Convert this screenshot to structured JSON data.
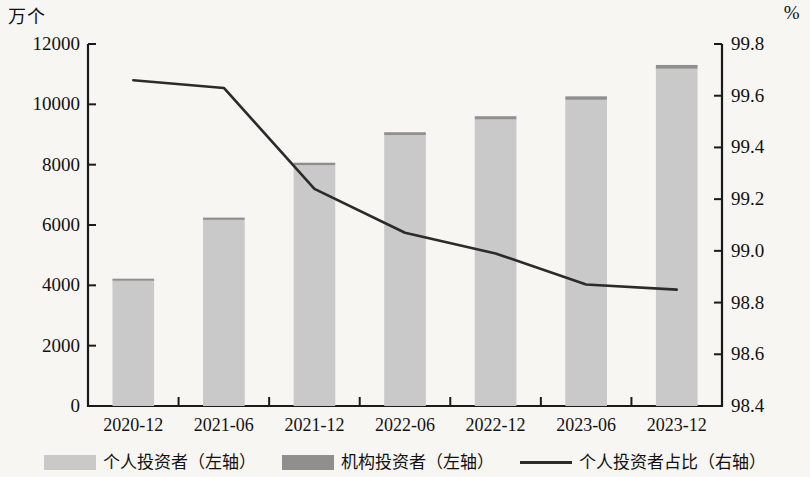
{
  "axes": {
    "left_unit": "万个",
    "right_unit": "%",
    "left_ticks": [
      "12000",
      "10000",
      "8000",
      "6000",
      "4000",
      "2000",
      "0"
    ],
    "right_ticks": [
      "99.8",
      "99.6",
      "99.4",
      "99.2",
      "99.0",
      "98.8",
      "98.6",
      "98.4"
    ]
  },
  "legend": {
    "items": [
      {
        "label": "个人投资者（左轴）",
        "type": "swatch",
        "color": "#c9c9c9"
      },
      {
        "label": "机构投资者（左轴）",
        "type": "swatch",
        "color": "#8f8f8f"
      },
      {
        "label": "个人投资者占比（右轴）",
        "type": "line",
        "color": "#2b2b2b"
      }
    ]
  },
  "chart_data": {
    "type": "bar",
    "title": "",
    "xlabel": "",
    "ylabel": "万个",
    "y2label": "%",
    "ylim": [
      0,
      12000
    ],
    "y2lim": [
      98.4,
      99.8
    ],
    "grid": false,
    "legend_position": "bottom",
    "categories": [
      "2020-12",
      "2021-06",
      "2021-12",
      "2022-06",
      "2022-12",
      "2023-06",
      "2023-12"
    ],
    "series": [
      {
        "name": "个人投资者（左轴）",
        "type": "bar",
        "stack": "investors",
        "axis": "left",
        "color": "#c9c9c9",
        "values": [
          4150,
          6170,
          7980,
          8980,
          9500,
          10150,
          11180
        ]
      },
      {
        "name": "机构投资者（左轴）",
        "type": "bar",
        "stack": "investors",
        "axis": "left",
        "color": "#8f8f8f",
        "values": [
          70,
          75,
          85,
          95,
          105,
          115,
          125
        ]
      },
      {
        "name": "个人投资者占比（右轴）",
        "type": "line",
        "axis": "right",
        "color": "#2b2b2b",
        "values": [
          99.66,
          99.63,
          99.24,
          99.07,
          98.99,
          98.87,
          98.85
        ]
      }
    ]
  }
}
